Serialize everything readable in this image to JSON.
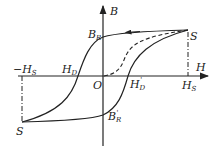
{
  "diagram": {
    "type": "hysteresis-loop",
    "axes": {
      "x_label": "H",
      "y_label": "B",
      "origin_label": "O"
    },
    "points": {
      "saturation_top": "S",
      "saturation_bottom": "S",
      "remanence_pos": {
        "main": "B",
        "sub": "R"
      },
      "remanence_neg": {
        "main": "B",
        "sub": "R",
        "prime": "'"
      },
      "coercive_neg": {
        "main": "H",
        "sub": "D"
      },
      "coercive_pos": {
        "main": "H",
        "sub": "D",
        "prime": "'"
      },
      "sat_field_neg": {
        "sign": "−",
        "main": "H",
        "sub": "S"
      },
      "sat_field_pos": {
        "main": "H",
        "sub": "S"
      }
    },
    "colors": {
      "line": "#222222",
      "background": "#ffffff"
    }
  }
}
